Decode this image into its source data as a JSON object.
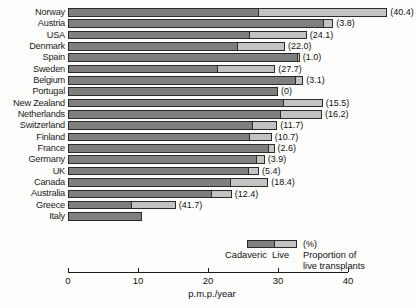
{
  "chart_data": {
    "type": "bar",
    "orientation": "horizontal",
    "stacked": true,
    "title": "",
    "xlabel": "p.m.p./year",
    "ylabel": "",
    "xlim": [
      0,
      40
    ],
    "xticks": [
      0,
      10,
      20,
      30,
      40
    ],
    "xtick_labels": [
      "0",
      "10",
      "20",
      "30",
      "40"
    ],
    "grid": false,
    "legend_position": "bottom-right",
    "categories": [
      "Norway",
      "Austria",
      "USA",
      "Denmark",
      "Spain",
      "Sweden",
      "Belgium",
      "Portugal",
      "New Zealand",
      "Netherlands",
      "Switzerland",
      "Finland",
      "France",
      "Germany",
      "UK",
      "Canada",
      "Australia",
      "Greece",
      "Italy"
    ],
    "series": [
      {
        "name": "Cadaveric",
        "color": "#807f7f",
        "values": [
          27.2,
          36.5,
          25.9,
          24.2,
          32.8,
          21.4,
          32.6,
          30.0,
          30.8,
          30.4,
          26.4,
          26.0,
          28.7,
          27.0,
          25.8,
          23.3,
          20.5,
          9.0,
          10.6
        ]
      },
      {
        "name": "Live",
        "color": "#c3c3c3",
        "values": [
          18.4,
          1.4,
          8.2,
          6.8,
          0.3,
          8.2,
          1.0,
          0.0,
          5.6,
          5.9,
          3.5,
          3.1,
          0.8,
          1.1,
          1.5,
          5.3,
          2.9,
          6.4,
          0.0
        ]
      }
    ],
    "annotations": {
      "label": "Proportion of live transplants (%)",
      "values": [
        "(40.4)",
        "(3.8)",
        "(24.1)",
        "(22.0)",
        "(1.0)",
        "(27.7)",
        "(3.1)",
        "(0)",
        "(15.5)",
        "(16.2)",
        "(11.7)",
        "(10.7)",
        "(2.6)",
        "(3.9)",
        "(5.4)",
        "(18.4)",
        "(12.4)",
        "(41.7)",
        ""
      ]
    }
  },
  "legend": {
    "percent_label": "(%)",
    "cadaveric_label": "Cadaveric",
    "live_label": "Live",
    "description_line1": "Proportion of",
    "description_line2": "live transplants"
  },
  "axis": {
    "title": "p.m.p./year"
  }
}
